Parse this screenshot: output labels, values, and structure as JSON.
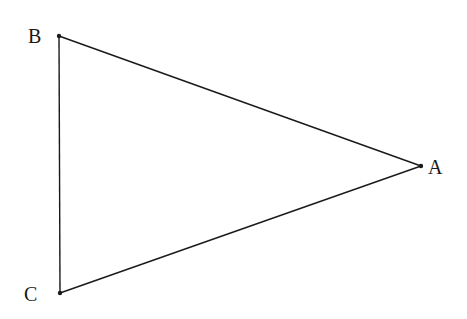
{
  "diagram": {
    "type": "triangle",
    "stroke_color": "#1a1a1a",
    "vertices": [
      {
        "name": "B",
        "x": 59,
        "y": 36,
        "label_x": 28,
        "label_y": 43
      },
      {
        "name": "A",
        "x": 421,
        "y": 166,
        "label_x": 428,
        "label_y": 174
      },
      {
        "name": "C",
        "x": 60,
        "y": 293,
        "label_x": 24,
        "label_y": 301
      }
    ],
    "edges": [
      {
        "from": "B",
        "to": "A"
      },
      {
        "from": "A",
        "to": "C"
      },
      {
        "from": "C",
        "to": "B"
      }
    ]
  }
}
